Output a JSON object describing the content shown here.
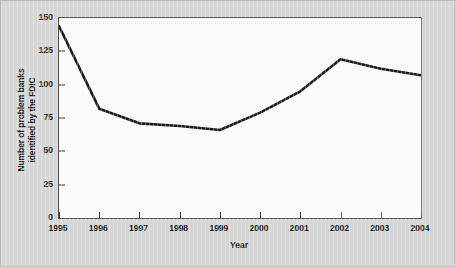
{
  "chart_data": {
    "type": "line",
    "title": "",
    "subtitle": "",
    "xlabel": "Year",
    "ylabel": "Number of problem banks identified by the FDIC",
    "ylabel_line1": "Number of problem banks",
    "ylabel_line2": "identified by the FDIC",
    "categories": [
      "1995",
      "1996",
      "1997",
      "1998",
      "1999",
      "2000",
      "2001",
      "2002",
      "2003",
      "2004"
    ],
    "x": [
      1995,
      1996,
      1997,
      1998,
      1999,
      2000,
      2001,
      2002,
      2003,
      2004
    ],
    "values": [
      144,
      82,
      71,
      69,
      66,
      79,
      95,
      119,
      112,
      107
    ],
    "series": [
      {
        "name": "Number of problem banks identified by the FDIC",
        "values": [
          144,
          82,
          71,
          69,
          66,
          79,
          95,
          119,
          112,
          107
        ]
      }
    ],
    "xlim": [
      1995,
      2004
    ],
    "ylim": [
      0,
      150
    ],
    "yticks": [
      0,
      25,
      50,
      75,
      100,
      125,
      150
    ],
    "ytick_labels": [
      "0",
      "25",
      "50",
      "75",
      "100",
      "125",
      "150"
    ],
    "xticks": [
      1995,
      1996,
      1997,
      1998,
      1999,
      2000,
      2001,
      2002,
      2003,
      2004
    ],
    "xtick_labels": [
      "1995",
      "1996",
      "1997",
      "1998",
      "1999",
      "2000",
      "2001",
      "2002",
      "2003",
      "2004"
    ],
    "grid": false,
    "legend": false,
    "legend_position": "none",
    "annotations": []
  },
  "style": {
    "figure_background": "#d6d6d6",
    "plot_background": "#fbfbfb",
    "line_color": "#1c1c1c",
    "axis_color": "#4a4a4a",
    "text_color": "#171717",
    "line_width": 2.6
  }
}
